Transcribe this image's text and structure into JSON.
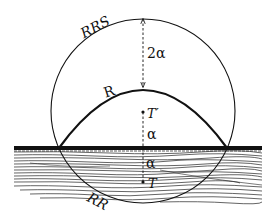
{
  "figure": {
    "labels": {
      "rrs": "RRS",
      "r": "R",
      "rr": "RR",
      "t_prime": "T′",
      "t": "T",
      "two_alpha": "2α",
      "alpha_upper": "α",
      "alpha_lower": "α"
    },
    "colors": {
      "ink": "#111111",
      "background": "#ffffff"
    }
  }
}
